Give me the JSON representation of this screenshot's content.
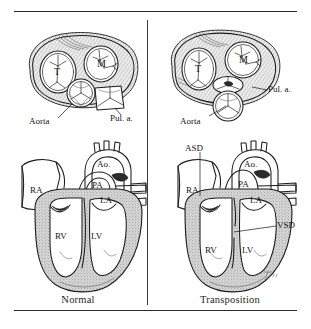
{
  "figure": {
    "title_visible": false,
    "panels": [
      {
        "id": "normal-valves",
        "position": "top-left",
        "view": "great-vessel and atrioventricular valve cross-section",
        "labels": [
          {
            "name": "tricuspid-valve",
            "text": "T"
          },
          {
            "name": "mitral-valve",
            "text": "M"
          },
          {
            "name": "aorta",
            "text": "Aorta"
          },
          {
            "name": "pulmonary-artery",
            "text": "Pul. a."
          }
        ]
      },
      {
        "id": "transposition-valves",
        "position": "top-right",
        "view": "great-vessel and atrioventricular valve cross-section",
        "labels": [
          {
            "name": "tricuspid-valve",
            "text": "T"
          },
          {
            "name": "mitral-valve",
            "text": "M"
          },
          {
            "name": "aorta",
            "text": "Aorta"
          },
          {
            "name": "pulmonary-artery",
            "text": "Pul. a."
          }
        ]
      },
      {
        "id": "normal-heart",
        "position": "bottom-left",
        "view": "four-chamber coronal section",
        "caption": "Normal",
        "labels": [
          {
            "name": "aorta",
            "text": "Ao."
          },
          {
            "name": "pulmonary-artery",
            "text": "PA"
          },
          {
            "name": "left-atrium",
            "text": "LA"
          },
          {
            "name": "right-atrium",
            "text": "RA"
          },
          {
            "name": "right-ventricle",
            "text": "RV"
          },
          {
            "name": "left-ventricle",
            "text": "LV"
          }
        ]
      },
      {
        "id": "transposition-heart",
        "position": "bottom-right",
        "view": "four-chamber coronal section",
        "caption": "Transposition",
        "labels": [
          {
            "name": "aorta",
            "text": "Ao."
          },
          {
            "name": "pulmonary-artery",
            "text": "PA"
          },
          {
            "name": "left-atrium",
            "text": "LA"
          },
          {
            "name": "right-atrium",
            "text": "RA"
          },
          {
            "name": "right-ventricle",
            "text": "RV"
          },
          {
            "name": "left-ventricle",
            "text": "LV"
          },
          {
            "name": "atrial-septal-defect",
            "text": "ASD"
          },
          {
            "name": "ventricular-septal-defect",
            "text": "VSD"
          }
        ]
      }
    ],
    "captions": {
      "left": "Normal",
      "right": "Transposition"
    },
    "colors": {
      "ink": "#1c1c1c",
      "rule": "#2b2b2b",
      "paper": "#ffffff",
      "wall_tone": "#b9b9b9"
    }
  }
}
